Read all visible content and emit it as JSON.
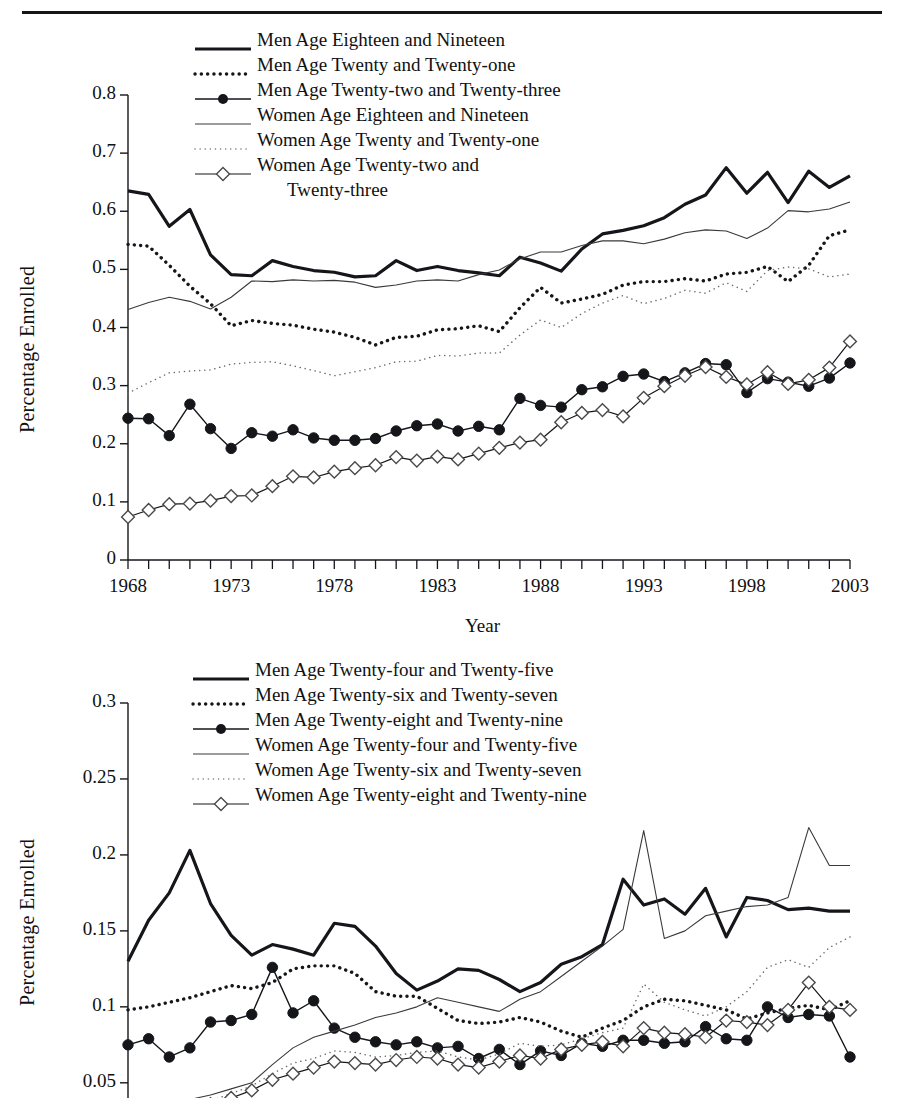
{
  "header": {
    "title_fragment": ""
  },
  "chart_data": [
    {
      "type": "line",
      "title": "",
      "xlabel": "Year",
      "ylabel": "Percentage Enrolled",
      "ylim": [
        0,
        0.8
      ],
      "yticks": [
        "0",
        "0.1",
        "0.2",
        "0.3",
        "0.4",
        "0.5",
        "0.6",
        "0.7",
        "0.8"
      ],
      "ytickvals": [
        0,
        0.1,
        0.2,
        0.3,
        0.4,
        0.5,
        0.6,
        0.7,
        0.8
      ],
      "xlim": [
        1968,
        2003
      ],
      "xticks": [
        "1968",
        "1973",
        "1978",
        "1983",
        "1988",
        "1993",
        "1998",
        "2003"
      ],
      "xtickvals": [
        1968,
        1973,
        1978,
        1983,
        1988,
        1993,
        1998,
        2003
      ],
      "grid": false,
      "legend_position": "top-center",
      "x": [
        1968,
        1969,
        1970,
        1971,
        1972,
        1973,
        1974,
        1975,
        1976,
        1977,
        1978,
        1979,
        1980,
        1981,
        1982,
        1983,
        1984,
        1985,
        1986,
        1987,
        1988,
        1989,
        1990,
        1991,
        1992,
        1993,
        1994,
        1995,
        1996,
        1997,
        1998,
        1999,
        2000,
        2001,
        2002,
        2003
      ],
      "series": [
        {
          "name": "Men Age Eighteen and Nineteen",
          "style": "thick-solid",
          "values": [
            0.635,
            0.629,
            0.574,
            0.603,
            0.525,
            0.491,
            0.489,
            0.515,
            0.505,
            0.498,
            0.495,
            0.487,
            0.489,
            0.515,
            0.498,
            0.505,
            0.498,
            0.494,
            0.489,
            0.521,
            0.511,
            0.497,
            0.535,
            0.561,
            0.567,
            0.575,
            0.589,
            0.612,
            0.628,
            0.675,
            0.631,
            0.667,
            0.615,
            0.669,
            0.641,
            0.661
          ]
        },
        {
          "name": "Men Age Twenty and Twenty-one",
          "style": "thick-dotted",
          "values": [
            0.543,
            0.54,
            0.507,
            0.471,
            0.441,
            0.403,
            0.412,
            0.407,
            0.404,
            0.397,
            0.392,
            0.383,
            0.37,
            0.383,
            0.385,
            0.396,
            0.398,
            0.403,
            0.393,
            0.434,
            0.469,
            0.442,
            0.449,
            0.457,
            0.473,
            0.479,
            0.479,
            0.484,
            0.48,
            0.492,
            0.495,
            0.505,
            0.479,
            0.507,
            0.558,
            0.568
          ]
        },
        {
          "name": "Men Age Twenty-two and Twenty-three",
          "style": "dot-marker",
          "values": [
            0.244,
            0.243,
            0.214,
            0.268,
            0.226,
            0.192,
            0.219,
            0.213,
            0.224,
            0.21,
            0.206,
            0.206,
            0.209,
            0.222,
            0.231,
            0.234,
            0.222,
            0.23,
            0.224,
            0.278,
            0.266,
            0.263,
            0.293,
            0.298,
            0.316,
            0.32,
            0.307,
            0.322,
            0.338,
            0.336,
            0.288,
            0.312,
            0.306,
            0.299,
            0.313,
            0.339
          ]
        },
        {
          "name": "Women Age Eighteen and Nineteen",
          "style": "thin-solid",
          "values": [
            0.431,
            0.443,
            0.452,
            0.445,
            0.432,
            0.452,
            0.48,
            0.479,
            0.482,
            0.48,
            0.481,
            0.478,
            0.469,
            0.473,
            0.48,
            0.482,
            0.48,
            0.491,
            0.499,
            0.518,
            0.53,
            0.53,
            0.541,
            0.549,
            0.549,
            0.544,
            0.552,
            0.563,
            0.568,
            0.566,
            0.553,
            0.571,
            0.601,
            0.599,
            0.604,
            0.616
          ]
        },
        {
          "name": "Women Age Twenty and Twenty-one",
          "style": "thin-dotted",
          "values": [
            0.287,
            0.305,
            0.322,
            0.325,
            0.327,
            0.337,
            0.34,
            0.341,
            0.334,
            0.326,
            0.317,
            0.324,
            0.331,
            0.341,
            0.342,
            0.352,
            0.351,
            0.356,
            0.356,
            0.387,
            0.413,
            0.4,
            0.424,
            0.442,
            0.455,
            0.441,
            0.45,
            0.464,
            0.459,
            0.477,
            0.462,
            0.498,
            0.504,
            0.501,
            0.487,
            0.492
          ]
        },
        {
          "name": "Women Age Twenty-two and Twenty-three",
          "style": "diamond-marker",
          "values": [
            0.074,
            0.086,
            0.096,
            0.097,
            0.102,
            0.11,
            0.111,
            0.127,
            0.144,
            0.142,
            0.152,
            0.158,
            0.163,
            0.177,
            0.171,
            0.178,
            0.173,
            0.183,
            0.193,
            0.202,
            0.207,
            0.237,
            0.253,
            0.258,
            0.247,
            0.279,
            0.299,
            0.317,
            0.332,
            0.315,
            0.302,
            0.323,
            0.303,
            0.31,
            0.331,
            0.376
          ]
        }
      ]
    },
    {
      "type": "line",
      "title": "",
      "xlabel": "Year",
      "ylabel": "Percentage Enrolled",
      "ylim": [
        0.04,
        0.3
      ],
      "yticks": [
        "0.05",
        "0.1",
        "0.15",
        "0.2",
        "0.25",
        "0.3"
      ],
      "ytickvals": [
        0.05,
        0.1,
        0.15,
        0.2,
        0.25,
        0.3
      ],
      "xlim": [
        1968,
        2003
      ],
      "xticks": [],
      "xtickvals": [],
      "grid": false,
      "legend_position": "top-center",
      "x": [
        1968,
        1969,
        1970,
        1971,
        1972,
        1973,
        1974,
        1975,
        1976,
        1977,
        1978,
        1979,
        1980,
        1981,
        1982,
        1983,
        1984,
        1985,
        1986,
        1987,
        1988,
        1989,
        1990,
        1991,
        1992,
        1993,
        1994,
        1995,
        1996,
        1997,
        1998,
        1999,
        2000,
        2001,
        2002,
        2003
      ],
      "series": [
        {
          "name": "Men Age Twenty-four and Twenty-five",
          "style": "thick-solid",
          "values": [
            0.13,
            0.157,
            0.175,
            0.203,
            0.168,
            0.147,
            0.134,
            0.141,
            0.138,
            0.134,
            0.155,
            0.153,
            0.14,
            0.122,
            0.111,
            0.117,
            0.125,
            0.124,
            0.118,
            0.11,
            0.116,
            0.128,
            0.133,
            0.141,
            0.184,
            0.167,
            0.171,
            0.161,
            0.178,
            0.146,
            0.172,
            0.17,
            0.164,
            0.165,
            0.163,
            0.163
          ]
        },
        {
          "name": "Men Age Twenty-six and Twenty-seven",
          "style": "thick-dotted",
          "values": [
            0.098,
            0.1,
            0.103,
            0.106,
            0.11,
            0.114,
            0.112,
            0.116,
            0.125,
            0.127,
            0.127,
            0.122,
            0.11,
            0.107,
            0.107,
            0.099,
            0.091,
            0.089,
            0.09,
            0.093,
            0.09,
            0.084,
            0.08,
            0.086,
            0.091,
            0.1,
            0.105,
            0.104,
            0.101,
            0.098,
            0.092,
            0.096,
            0.099,
            0.101,
            0.098,
            0.104
          ]
        },
        {
          "name": "Men Age Twenty-eight and Twenty-nine",
          "style": "dot-marker",
          "values": [
            0.075,
            0.079,
            0.067,
            0.073,
            0.09,
            0.091,
            0.095,
            0.126,
            0.096,
            0.104,
            0.086,
            0.08,
            0.077,
            0.075,
            0.077,
            0.073,
            0.074,
            0.066,
            0.072,
            0.062,
            0.071,
            0.068,
            0.076,
            0.074,
            0.078,
            0.078,
            0.076,
            0.077,
            0.087,
            0.079,
            0.078,
            0.1,
            0.093,
            0.095,
            0.094,
            0.067
          ]
        },
        {
          "name": "Women Age Twenty-four and Twenty-five",
          "style": "thin-solid",
          "values": [
            0.03,
            0.033,
            0.036,
            0.039,
            0.042,
            0.046,
            0.05,
            0.062,
            0.073,
            0.08,
            0.084,
            0.088,
            0.093,
            0.096,
            0.1,
            0.106,
            0.103,
            0.1,
            0.097,
            0.105,
            0.11,
            0.12,
            0.13,
            0.14,
            0.151,
            0.216,
            0.145,
            0.15,
            0.16,
            0.163,
            0.166,
            0.167,
            0.172,
            0.218,
            0.193,
            0.193
          ]
        },
        {
          "name": "Women Age Twenty-six and Twenty-seven",
          "style": "thin-dotted",
          "values": [
            0.026,
            0.029,
            0.032,
            0.035,
            0.038,
            0.043,
            0.048,
            0.056,
            0.063,
            0.066,
            0.071,
            0.07,
            0.067,
            0.068,
            0.07,
            0.071,
            0.067,
            0.065,
            0.069,
            0.076,
            0.074,
            0.075,
            0.079,
            0.083,
            0.086,
            0.115,
            0.103,
            0.098,
            0.094,
            0.1,
            0.11,
            0.126,
            0.131,
            0.126,
            0.139,
            0.146
          ]
        },
        {
          "name": "Women Age Twenty-eight and Twenty-nine",
          "style": "diamond-marker",
          "values": [
            0.024,
            0.027,
            0.03,
            0.033,
            0.036,
            0.04,
            0.045,
            0.052,
            0.056,
            0.06,
            0.064,
            0.063,
            0.062,
            0.065,
            0.067,
            0.066,
            0.062,
            0.06,
            0.064,
            0.068,
            0.066,
            0.072,
            0.075,
            0.077,
            0.074,
            0.086,
            0.083,
            0.082,
            0.08,
            0.091,
            0.09,
            0.088,
            0.098,
            0.116,
            0.1,
            0.098
          ]
        }
      ]
    }
  ]
}
